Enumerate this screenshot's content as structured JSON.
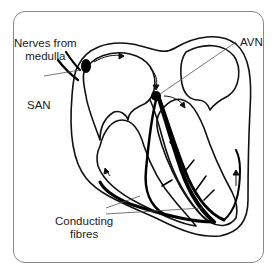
{
  "diagram": {
    "labels": {
      "nerves": [
        "Nerves from",
        "medulla"
      ],
      "san": "SAN",
      "avn": "AVN",
      "conducting": [
        "Conducting",
        "fibres"
      ]
    },
    "colors": {
      "outline": "#111111",
      "frame": "#8a8a8a",
      "leader": "#555555",
      "background": "#ffffff"
    }
  }
}
